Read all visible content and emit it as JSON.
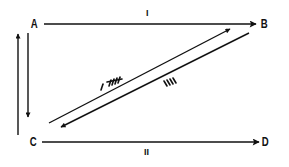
{
  "diagram": {
    "type": "directed-graph",
    "stroke_color": "#111111",
    "background": "#ffffff",
    "nodes": [
      {
        "id": "A",
        "label": "A"
      },
      {
        "id": "B",
        "label": "B"
      },
      {
        "id": "C",
        "label": "C"
      },
      {
        "id": "D",
        "label": "D"
      }
    ],
    "edges": [
      {
        "from": "A",
        "to": "B",
        "label": "I"
      },
      {
        "from": "C",
        "to": "D",
        "label": "II"
      },
      {
        "from": "C",
        "to": "A",
        "label": ""
      },
      {
        "from": "A",
        "to": "C",
        "label": ""
      },
      {
        "from": "C",
        "to": "B",
        "label": "I 卅"
      },
      {
        "from": "B",
        "to": "C",
        "label": "IIII"
      }
    ]
  }
}
